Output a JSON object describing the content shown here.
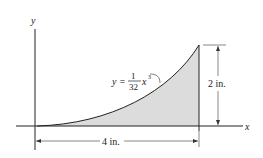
{
  "diagram": {
    "axes": {
      "x_label": "x",
      "y_label": "y"
    },
    "equation": {
      "lhs": "y =",
      "numerator": "1",
      "denominator": "32",
      "variable": "x",
      "exponent": "3"
    },
    "dimensions": {
      "height": "2 in.",
      "width": "4 in."
    },
    "colors": {
      "fill": "#d9d9d9",
      "stroke": "#222222"
    }
  }
}
